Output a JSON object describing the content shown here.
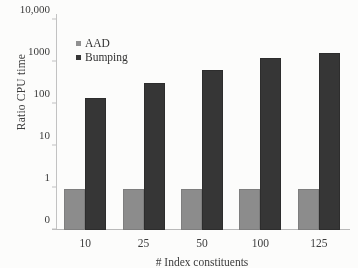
{
  "chart_data": {
    "type": "bar",
    "title": "",
    "xlabel": "# Index constituents",
    "ylabel": "Ratio CPU time",
    "categories": [
      "10",
      "25",
      "50",
      "100",
      "125"
    ],
    "series": [
      {
        "name": "AAD",
        "color": "#8b8b8b",
        "values": [
          0.95,
          0.95,
          0.95,
          0.96,
          0.97
        ]
      },
      {
        "name": "Bumping",
        "color": "#333333",
        "values": [
          140,
          320,
          640,
          1280,
          1650
        ]
      }
    ],
    "yscale": "log",
    "ytick_labels": [
      "10,000",
      "1000",
      "100",
      "10",
      "1",
      "0"
    ],
    "ytick_values": [
      10000,
      1000,
      100,
      10,
      1,
      0
    ],
    "ylim": [
      0,
      10000
    ],
    "grid": false,
    "legend_position": "top-left"
  },
  "legend": {
    "items": [
      {
        "label": "AAD",
        "swatch": "legend-swatch-aad"
      },
      {
        "label": "Bumping",
        "swatch": "legend-swatch-bumping"
      }
    ]
  }
}
